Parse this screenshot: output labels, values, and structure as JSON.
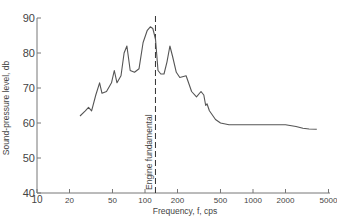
{
  "chart_data": {
    "type": "line",
    "title": "",
    "xlabel": "Frequency, f, cps",
    "ylabel": "Sound-pressure level, db",
    "xscale": "log",
    "xlim": [
      10,
      5000
    ],
    "ylim": [
      40,
      90
    ],
    "x_ticks": [
      10,
      20,
      50,
      100,
      200,
      500,
      1000,
      2000,
      5000
    ],
    "x_tick_labels": [
      "10",
      "20",
      "50",
      "100",
      "200",
      "500",
      "1000",
      "2000",
      "5000"
    ],
    "y_ticks": [
      40,
      50,
      60,
      70,
      80,
      90
    ],
    "y_tick_labels": [
      "40",
      "50",
      "60",
      "70",
      "80",
      "90"
    ],
    "grid": false,
    "legend": null,
    "annotations": [
      {
        "type": "vertical-dashed-line",
        "x": 125,
        "label": "Engine fundamental"
      }
    ],
    "series": [
      {
        "name": "Sound-pressure spectrum",
        "x": [
          25,
          28,
          30,
          32,
          35,
          38,
          40,
          44,
          49,
          52,
          55,
          60,
          64,
          68,
          73,
          80,
          88,
          96,
          105,
          112,
          118,
          125,
          132,
          140,
          150,
          160,
          170,
          180,
          195,
          210,
          240,
          270,
          300,
          330,
          350,
          365,
          375,
          395,
          450,
          500,
          600,
          800,
          1000,
          1500,
          2000,
          2500,
          2900,
          3300,
          3900
        ],
        "y": [
          62,
          63.5,
          64.5,
          63.5,
          68,
          71.5,
          68.5,
          69,
          71.5,
          75,
          71.5,
          73.5,
          80,
          82,
          75,
          74.5,
          75.5,
          83,
          86.5,
          87.5,
          87,
          84,
          75,
          74,
          74,
          77.5,
          82,
          79,
          74.5,
          73,
          73.5,
          69,
          67.5,
          69,
          68,
          65,
          65.5,
          63.5,
          61,
          60,
          59.5,
          59.5,
          59.5,
          59.5,
          59.5,
          59,
          58.5,
          58.3,
          58.2
        ]
      }
    ]
  }
}
